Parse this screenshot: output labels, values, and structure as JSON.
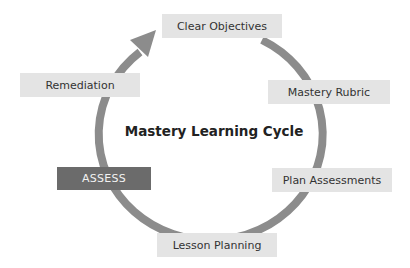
{
  "diagram": {
    "title": "Mastery Learning Cycle",
    "colors": {
      "arc": "#8c8c8c",
      "node_fill": "#e4e4e4",
      "node_text": "#333333",
      "active_fill": "#6b6b6b",
      "active_text": "#f2f2f2"
    },
    "nodes": [
      {
        "id": "clear-objectives",
        "label": "Clear Objectives",
        "active": false
      },
      {
        "id": "mastery-rubric",
        "label": "Mastery Rubric",
        "active": false
      },
      {
        "id": "plan-assessments",
        "label": "Plan Assessments",
        "active": false
      },
      {
        "id": "lesson-planning",
        "label": "Lesson Planning",
        "active": false
      },
      {
        "id": "assess",
        "label": "ASSESS",
        "active": true
      },
      {
        "id": "remediation",
        "label": "Remediation",
        "active": false
      }
    ],
    "flow": "clockwise"
  }
}
